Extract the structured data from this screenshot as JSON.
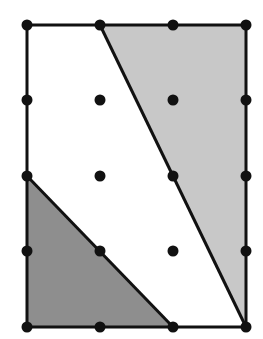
{
  "diagram": {
    "type": "lattice-grid-with-shaded-regions",
    "grid": {
      "columns": 4,
      "rows": 5,
      "x_positions": [
        27,
        100,
        173,
        246
      ],
      "y_positions": [
        25,
        100,
        176,
        251,
        327
      ]
    },
    "rectangle": {
      "x1": 27,
      "y1": 25,
      "x2": 246,
      "y2": 327
    },
    "regions": [
      {
        "name": "light-gray-quadrilateral",
        "color": "#c8c8c8",
        "points": [
          [
            100,
            25
          ],
          [
            246,
            25
          ],
          [
            246,
            327
          ]
        ]
      },
      {
        "name": "dark-gray-triangle",
        "color": "#8e8e8e",
        "points": [
          [
            27,
            176
          ],
          [
            27,
            327
          ],
          [
            173,
            327
          ]
        ]
      }
    ],
    "colors": {
      "stroke": "#111111",
      "dot": "#111111",
      "background": "#ffffff"
    }
  }
}
